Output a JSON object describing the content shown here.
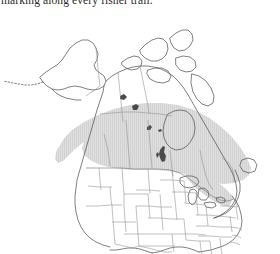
{
  "caption": {
    "line": "marking along every fisher trail."
  },
  "figure": {
    "name": "north-america-range-map",
    "background_color": "#ffffff",
    "outline_color": "#4a4a4a",
    "internal_border_color": "#8d8d8d",
    "range_fill_color": "#dcdcdc",
    "range_hatch_color": "#cfcfcf",
    "lake_color": "#3a3a3a"
  },
  "legend": {
    "range_label": "Distribution range",
    "range_swatch_color": "#dcdcdc"
  },
  "regions": {
    "countries": [
      "Canada",
      "United States",
      "Mexico"
    ],
    "range_extent": "Southern Canada from Pacific coast east to the Maritimes, extending south into the northern United States, the Great Lakes region and New England"
  }
}
